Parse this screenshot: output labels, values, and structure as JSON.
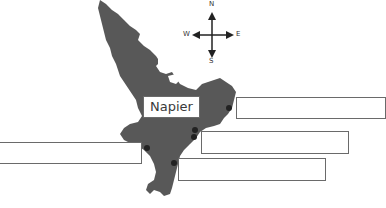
{
  "diagram": {
    "type": "labelled map",
    "region": "North Island, New Zealand",
    "map_color": "#585858",
    "labels": {
      "napier": "Napier"
    },
    "compass": {
      "north": "N",
      "south": "S",
      "east": "E",
      "west": "W"
    },
    "answer_boxes": [
      {
        "id": "box-1",
        "value": ""
      },
      {
        "id": "box-2",
        "value": ""
      },
      {
        "id": "box-3",
        "value": ""
      },
      {
        "id": "box-4",
        "value": ""
      }
    ]
  }
}
